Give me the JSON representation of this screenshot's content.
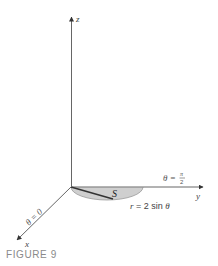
{
  "figure": {
    "caption": "FIGURE 9",
    "axes": {
      "z_label": "z",
      "y_label": "y",
      "x_label": "x"
    },
    "annotations": {
      "theta_half_pi_lhs": "θ = ",
      "theta_half_pi_num": "π",
      "theta_half_pi_den": "2",
      "theta_zero": "θ = 0",
      "region_label": "S",
      "curve_r": "r",
      "curve_rest": " = 2 sin ",
      "curve_theta": "θ"
    },
    "colors": {
      "axis": "#555555",
      "region_fill": "#cfcfcf",
      "region_stroke": "#9a9a9a",
      "radius_line": "#333333",
      "caption": "#8a8a8a"
    }
  }
}
